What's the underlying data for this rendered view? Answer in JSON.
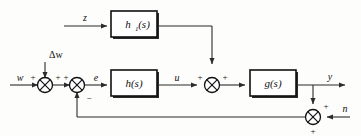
{
  "diagram": {
    "type": "control-system-block-diagram",
    "colors": {
      "background": "#fdfdfb",
      "wire": "#2b2b2b",
      "block_stroke": "#111111",
      "block_fill": "#ffffff",
      "text": "#111111"
    },
    "blocks": [
      {
        "id": "hf",
        "label": "h",
        "subscript": "1",
        "suffix": "(s)",
        "full_label": "h1(s)",
        "role": "feedforward-controller"
      },
      {
        "id": "h",
        "label": "h",
        "subscript": "",
        "suffix": "(s)",
        "full_label": "h(s)",
        "role": "feedback-controller"
      },
      {
        "id": "g",
        "label": "g",
        "subscript": "",
        "suffix": "(s)",
        "full_label": "g(s)",
        "role": "plant"
      }
    ],
    "signals": [
      {
        "id": "z",
        "label": "z",
        "role": "feedforward-input"
      },
      {
        "id": "dw",
        "label": "Δw",
        "role": "reference-disturbance"
      },
      {
        "id": "w",
        "label": "w",
        "role": "reference-input"
      },
      {
        "id": "e",
        "label": "e",
        "role": "error-signal"
      },
      {
        "id": "u",
        "label": "u",
        "role": "control-signal"
      },
      {
        "id": "y",
        "label": "y",
        "role": "plant-output"
      },
      {
        "id": "n",
        "label": "n",
        "role": "measurement-noise"
      }
    ],
    "summing_junctions": [
      {
        "id": "sum-w-dw",
        "role": "reference-plus-disturbance",
        "signs": [
          {
            "label": "+",
            "position": "left"
          },
          {
            "label": "+",
            "position": "right"
          }
        ]
      },
      {
        "id": "sum-error",
        "role": "error-junction",
        "signs": [
          {
            "label": "+",
            "position": "left"
          },
          {
            "label": "−",
            "position": "bottom-right"
          }
        ]
      },
      {
        "id": "sum-control",
        "role": "control-plus-feedforward",
        "signs": [
          {
            "label": "+",
            "position": "left"
          },
          {
            "label": "+",
            "position": "right"
          }
        ]
      },
      {
        "id": "sum-noise",
        "role": "output-plus-noise",
        "signs": [
          {
            "label": "+",
            "position": "top-right"
          },
          {
            "label": "+",
            "position": "bottom"
          }
        ]
      }
    ]
  }
}
